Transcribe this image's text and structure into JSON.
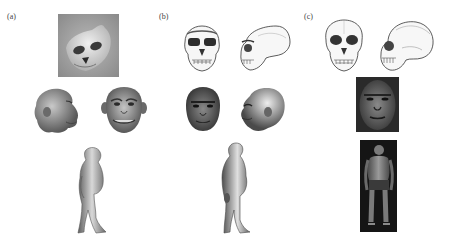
{
  "figure": {
    "panels": [
      {
        "label": "(a)",
        "items": [
          "skull-photo",
          "head-side-reconstruction",
          "head-front-reconstruction",
          "full-body-reconstruction"
        ]
      },
      {
        "label": "(b)",
        "items": [
          "skull-front-drawing",
          "skull-side-drawing",
          "head-front-reconstruction",
          "head-side-reconstruction",
          "full-body-reconstruction"
        ]
      },
      {
        "label": "(c)",
        "items": [
          "skull-front-drawing",
          "skull-side-drawing",
          "face-photo-reconstruction",
          "full-body-photo-reconstruction"
        ]
      }
    ],
    "colors": {
      "background": "#ffffff",
      "photo_gray": "#9a9a9a",
      "dark_photo": "#1a1a1a",
      "ink": "#333333"
    }
  }
}
